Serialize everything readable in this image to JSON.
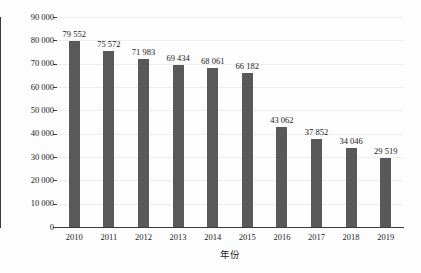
{
  "chart_data": {
    "type": "bar",
    "title": "",
    "xlabel": "年份",
    "ylabel": "死亡人数/人",
    "categories": [
      "2010",
      "2011",
      "2012",
      "2013",
      "2014",
      "2015",
      "2016",
      "2017",
      "2018",
      "2019"
    ],
    "values": [
      79552,
      75572,
      71983,
      69434,
      68061,
      66182,
      43062,
      37852,
      34046,
      29519
    ],
    "value_labels": [
      "79 552",
      "75 572",
      "71 983",
      "69 434",
      "68 061",
      "66 182",
      "43 062",
      "37 852",
      "34 046",
      "29 519"
    ],
    "ylim": [
      0,
      90000
    ],
    "ytick_values": [
      90000,
      80000,
      70000,
      60000,
      50000,
      40000,
      30000,
      20000,
      10000,
      0
    ],
    "ytick_labels": [
      "90 000",
      "80 000",
      "70 000",
      "60 000",
      "50 000",
      "40 000",
      "30 000",
      "20 000",
      "10 000",
      "0"
    ],
    "grid": true,
    "legend": "none",
    "series_color": "#595959",
    "background_color": "#fdfdfd",
    "axis_color": "#3a3a3a",
    "gridline_color": "#ededed"
  }
}
